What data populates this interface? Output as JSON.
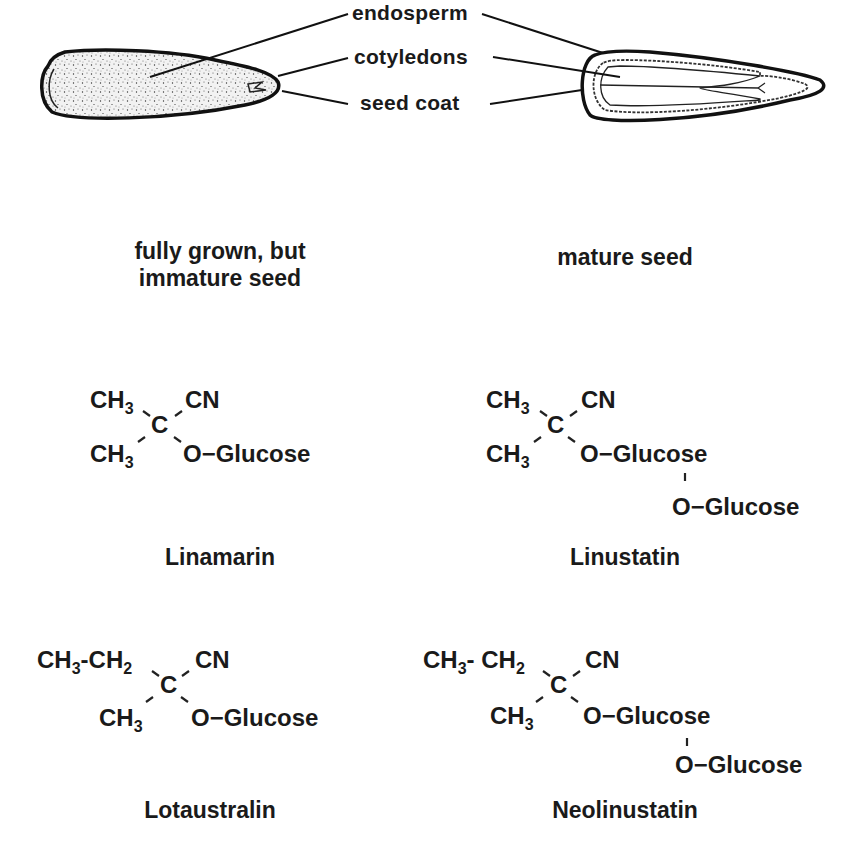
{
  "seed_diagram": {
    "labels": [
      "endosperm",
      "cotyledons",
      "seed coat"
    ],
    "captions": {
      "immature": [
        "fully grown, but",
        "immature seed"
      ],
      "mature": "mature seed"
    }
  },
  "compounds": [
    {
      "name": "Linamarin",
      "substituents": {
        "top_left": "CH",
        "top_left_sub": "3",
        "top_right": "CN",
        "center": "C",
        "bottom_left": "CH",
        "bottom_left_sub": "3",
        "bottom_right": "O−Glucose"
      }
    },
    {
      "name": "Linustatin",
      "substituents": {
        "top_left": "CH",
        "top_left_sub": "3",
        "top_right": "CN",
        "center": "C",
        "bottom_left": "CH",
        "bottom_left_sub": "3",
        "bottom_right": "O−Glucose",
        "extra": "O−Glucose"
      }
    },
    {
      "name": "Lotaustralin",
      "substituents": {
        "top_left_a": "CH",
        "top_left_a_sub": "3",
        "top_left_b": "CH",
        "top_left_b_sub": "2",
        "top_right": "CN",
        "center": "C",
        "bottom_left": "CH",
        "bottom_left_sub": "3",
        "bottom_right": "O−Glucose"
      }
    },
    {
      "name": "Neolinustatin",
      "substituents": {
        "top_left_a": "CH",
        "top_left_a_sub": "3",
        "top_left_b": "CH",
        "top_left_b_sub": "2",
        "top_right": "CN",
        "center": "C",
        "bottom_left": "CH",
        "bottom_left_sub": "3",
        "bottom_right": "O−Glucose",
        "extra": "O−Glucose"
      }
    }
  ]
}
